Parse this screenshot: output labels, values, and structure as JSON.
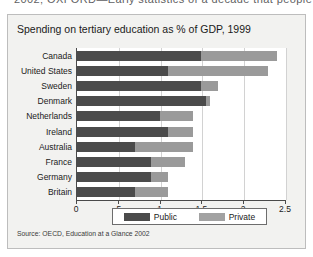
{
  "scan": {
    "top_cutoff_text": "2002; OXFORD—Early statistics of a decade that people"
  },
  "figure": {
    "title": "Spending on tertiary education as % of GDP, 1999",
    "source": "Source:  OECD, Education at a Glance 2002"
  },
  "legend": {
    "position": "bottom-center",
    "entries": [
      {
        "label": "Public",
        "color": "#4b4b4b",
        "swatch": "legend-swatch-public"
      },
      {
        "label": "Private",
        "color": "#a2a2a2",
        "swatch": "legend-swatch-private"
      }
    ]
  },
  "chart_data": {
    "type": "bar",
    "orientation": "horizontal",
    "stacked": true,
    "title": "Spending on tertiary education as % of GDP, 1999",
    "xlabel": "",
    "ylabel": "",
    "xlim": [
      0,
      2.5
    ],
    "ylim": null,
    "grid": true,
    "xticks": [
      0,
      0.5,
      1,
      1.5,
      2,
      2.5
    ],
    "xticklabels": [
      "0",
      ".5",
      "1",
      "1.5",
      "2",
      "2.5"
    ],
    "categories": [
      "Canada",
      "United States",
      "Sweden",
      "Denmark",
      "Netherlands",
      "Ireland",
      "Australia",
      "France",
      "Germany",
      "Britain"
    ],
    "series": [
      {
        "name": "Public",
        "color": "#4b4b4b",
        "values": [
          1.5,
          1.1,
          1.5,
          1.55,
          1.0,
          1.1,
          0.7,
          0.9,
          0.9,
          0.7
        ]
      },
      {
        "name": "Private",
        "color": "#9a9a9a",
        "values": [
          0.9,
          1.2,
          0.2,
          0.05,
          0.4,
          0.3,
          0.7,
          0.4,
          0.2,
          0.4
        ]
      }
    ],
    "totals": [
      2.4,
      2.3,
      1.7,
      1.6,
      1.4,
      1.4,
      1.4,
      1.3,
      1.1,
      1.1
    ],
    "units": "% of GDP",
    "annotations": []
  }
}
